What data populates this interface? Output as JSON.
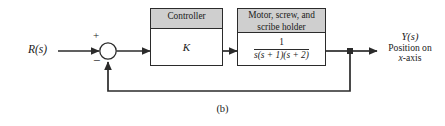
{
  "figure": {
    "caption": "(b)",
    "type": "control-system-block-diagram"
  },
  "colors": {
    "line": "#2b2b2b",
    "header_fill": "#cfcfcf",
    "block_fill": "#ffffff",
    "background": "#ffffff",
    "text": "#1a1a1a"
  },
  "input": {
    "label": "R(s)"
  },
  "summing_junction": {
    "name": "summing-junction",
    "positive_sign": "+",
    "negative_sign": "−"
  },
  "blocks": [
    {
      "id": "controller",
      "header": "Controller",
      "body": "K"
    },
    {
      "id": "plant",
      "header_line1": "Motor, screw, and",
      "header_line2": "scribe holder",
      "transfer_function": {
        "numerator": "1",
        "denominator": "s(s + 1)(s + 2)",
        "denominator_parts": [
          "s(",
          "s",
          " + 1)(",
          "s",
          " + 2)"
        ]
      }
    }
  ],
  "output": {
    "label": "Y(s)",
    "description_line1": "Position on",
    "description_line2_italic": "x",
    "description_line2_rest": "-axis"
  },
  "feedback": {
    "name": "unity-feedback-path",
    "gain": "1"
  }
}
